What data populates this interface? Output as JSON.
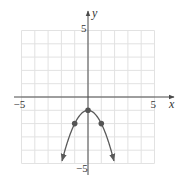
{
  "chart_data": {
    "type": "line",
    "title": "",
    "xlabel": "x",
    "ylabel": "y",
    "xlim": [
      -5,
      5
    ],
    "ylim": [
      -5,
      5
    ],
    "grid": true,
    "tick_labels": {
      "x": [
        {
          "value": -5,
          "label": "−5"
        },
        {
          "value": 5,
          "label": "5"
        }
      ],
      "y": [
        {
          "value": 5,
          "label": "5"
        },
        {
          "value": -5,
          "label": "−5"
        }
      ]
    },
    "series": [
      {
        "name": "y = -x^2 - 1",
        "equation": "y = -x^2 - 1",
        "x_range": [
          -1.95,
          1.95
        ],
        "arrows_at_ends": true,
        "points": [
          {
            "x": -1,
            "y": -2
          },
          {
            "x": 0,
            "y": -1
          },
          {
            "x": 1,
            "y": -2
          }
        ]
      }
    ],
    "colors": {
      "grid": "#e2e2e2",
      "axis": "#4a4a4a",
      "curve": "#5a5a5a",
      "point": "#555555"
    }
  },
  "layout": {
    "origin_px": [
      88,
      97
    ],
    "unit_px": 13.3
  }
}
